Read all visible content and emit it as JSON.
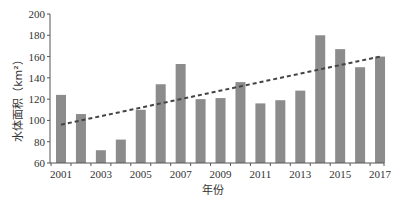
{
  "chart_data": {
    "type": "bar",
    "title": "",
    "xlabel": "年份",
    "ylabel": "水体面积（km²）",
    "ylim": [
      60,
      200
    ],
    "yticks": [
      60,
      80,
      100,
      120,
      140,
      160,
      180,
      200
    ],
    "xtick_labels": [
      "2001",
      "2003",
      "2005",
      "2007",
      "2009",
      "2011",
      "2013",
      "2015",
      "2017"
    ],
    "categories": [
      "2001",
      "2002",
      "2003",
      "2004",
      "2005",
      "2006",
      "2007",
      "2008",
      "2009",
      "2010",
      "2011",
      "2012",
      "2013",
      "2014",
      "2015",
      "2016",
      "2017"
    ],
    "values": [
      124,
      106,
      72,
      82,
      110,
      134,
      153,
      120,
      121,
      136,
      116,
      119,
      128,
      180,
      167,
      150,
      160
    ],
    "trendline": {
      "style": "dashed",
      "type": "linear",
      "start": {
        "x": "2001",
        "y": 96
      },
      "end": {
        "x": "2017",
        "y": 160
      }
    },
    "grid": false,
    "legend": null,
    "colors": {
      "bar": "#8c8c8c",
      "trend": "#444444",
      "axis": "#555555"
    }
  }
}
